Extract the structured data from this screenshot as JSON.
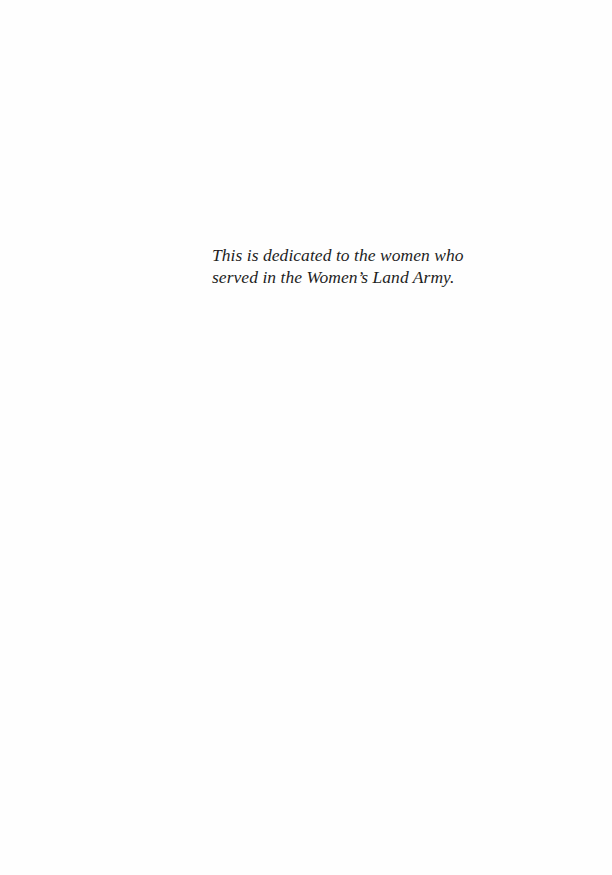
{
  "page": {
    "dedication": {
      "lines": [
        "This is dedicated to the women who",
        "served in the Women’s Land Army."
      ]
    }
  }
}
